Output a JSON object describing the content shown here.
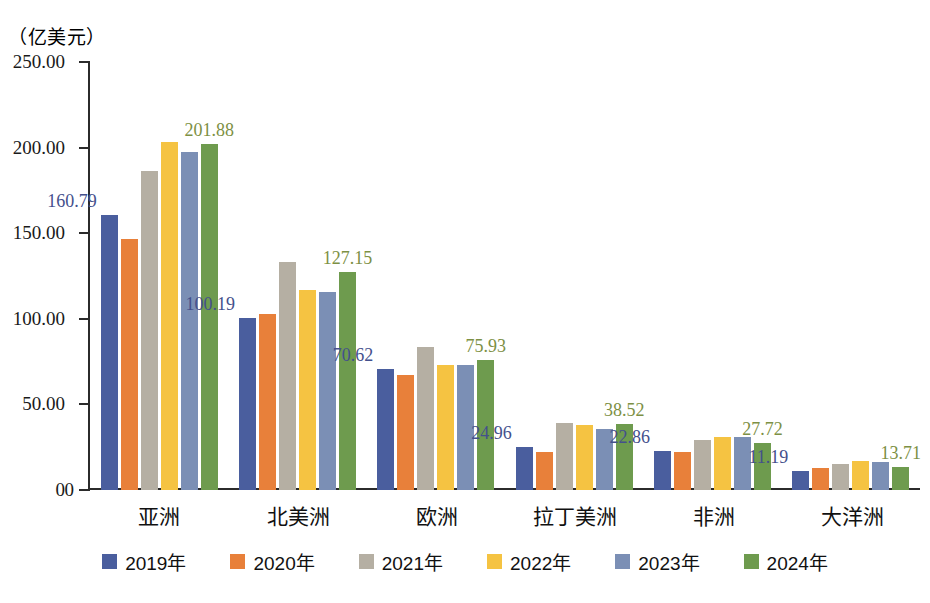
{
  "chart_data": {
    "type": "bar",
    "title": "",
    "unit_caption": "（亿美元）",
    "xlabel": "",
    "ylabel": "亿美元",
    "ylim": [
      0,
      250
    ],
    "yticks": [
      "0",
      "50.00",
      "100.00",
      "150.00",
      "200.00",
      "250.00"
    ],
    "ytick_values": [
      0,
      50,
      100,
      150,
      200,
      250
    ],
    "grid": false,
    "legend_position": "bottom",
    "categories": [
      "亚洲",
      "北美洲",
      "欧洲",
      "拉丁美洲",
      "非洲",
      "大洋洲"
    ],
    "series": [
      {
        "name": "2019年",
        "color": "#4A5E9E",
        "values": [
          160.79,
          100.19,
          70.62,
          24.96,
          22.86,
          11.19
        ]
      },
      {
        "name": "2020年",
        "color": "#E8803A",
        "values": [
          146.5,
          103.0,
          67.0,
          22.2,
          22.0,
          13.0
        ]
      },
      {
        "name": "2021年",
        "color": "#B5AFA3",
        "values": [
          186.5,
          133.0,
          83.8,
          39.0,
          29.3,
          15.2
        ]
      },
      {
        "name": "2022年",
        "color": "#F5C342",
        "values": [
          203.5,
          117.0,
          73.0,
          38.0,
          30.8,
          17.2
        ]
      },
      {
        "name": "2023年",
        "color": "#7B8FB5",
        "values": [
          197.5,
          115.5,
          73.0,
          35.8,
          31.0,
          16.2
        ]
      },
      {
        "name": "2024年",
        "color": "#6E9B4E",
        "values": [
          201.88,
          127.15,
          75.93,
          38.52,
          27.72,
          13.71
        ]
      }
    ],
    "annotations": [
      {
        "group": "亚洲",
        "series": "2019年",
        "text": "160.79",
        "color": "#44508c",
        "align": "left"
      },
      {
        "group": "亚洲",
        "series": "2024年",
        "text": "201.88",
        "color": "#7d9044",
        "align": "center"
      },
      {
        "group": "北美洲",
        "series": "2019年",
        "text": "100.19",
        "color": "#44508c",
        "align": "left"
      },
      {
        "group": "北美洲",
        "series": "2024年",
        "text": "127.15",
        "color": "#7d9044",
        "align": "center"
      },
      {
        "group": "欧洲",
        "series": "2019年",
        "text": "70.62",
        "color": "#44508c",
        "align": "left"
      },
      {
        "group": "欧洲",
        "series": "2024年",
        "text": "75.93",
        "color": "#7d9044",
        "align": "center"
      },
      {
        "group": "拉丁美洲",
        "series": "2019年",
        "text": "24.96",
        "color": "#44508c",
        "align": "left"
      },
      {
        "group": "拉丁美洲",
        "series": "2024年",
        "text": "38.52",
        "color": "#7d9044",
        "align": "center"
      },
      {
        "group": "非洲",
        "series": "2019年",
        "text": "22.86",
        "color": "#44508c",
        "align": "left"
      },
      {
        "group": "非洲",
        "series": "2024年",
        "text": "27.72",
        "color": "#7d9044",
        "align": "center"
      },
      {
        "group": "大洋洲",
        "series": "2019年",
        "text": "11.19",
        "color": "#44508c",
        "align": "left"
      },
      {
        "group": "大洋洲",
        "series": "2024年",
        "text": "13.71",
        "color": "#7d9044",
        "align": "center"
      }
    ]
  },
  "axis": {
    "unit_caption": "（亿美元）"
  }
}
